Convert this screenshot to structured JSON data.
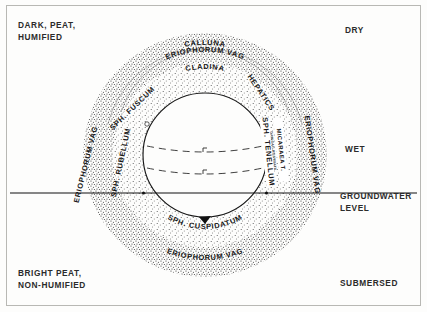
{
  "figure": {
    "type": "concentric-zonation-diagram"
  },
  "corner_labels": {
    "top_left": "DARK, PEAT,\nHUMIFIED",
    "bottom_left": "BRIGHT PEAT,\nNON-HUMIFIED",
    "top_right": "DRY",
    "middle_right": "WET",
    "bottom_right": "SUBMERSED"
  },
  "groundwater": {
    "label": "GROUNDWATER\nLEVEL",
    "line_label": "groundwater-level-line"
  },
  "ring_labels": {
    "top_outer_1": "CALLUNA",
    "top_outer_2": "ERIOPHORUM VAG",
    "top_inner": "CLADINA",
    "left_outer": "ERIOPHORUM VAG",
    "left_mid": "SPH. RUBELLUM",
    "left_inner": "SPH. FUSCUM",
    "right_inner": "HEPATICS",
    "right_mid_1": "MICARAEA T.",
    "right_mid_tiny": "CARICAC ROSTRATA",
    "right_mid_2": "SPH. TENELLUM",
    "right_outer": "ERIOPHORUM VAG",
    "bottom_inner": "SPH. CUSPIDATUM",
    "bottom_outer": "ERIOPHORUM VAG"
  },
  "colors": {
    "ink": "#171717",
    "stipple": "#2f2f2f",
    "paper": "#fdfdfc",
    "frame": "#b8b8b4"
  },
  "geometry": {
    "center_x": 205,
    "center_y": 155,
    "inner_pool_radius": 62,
    "mid_ring_radius": 92,
    "outer_ring_radius": 122,
    "groundwater_y": 193
  }
}
